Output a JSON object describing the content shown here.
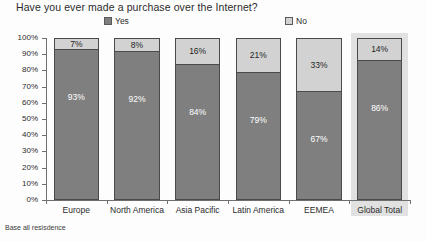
{
  "chart_data": {
    "type": "bar",
    "subtype": "stacked-100-percent",
    "title": "Have you ever made a purchase over the Internet?",
    "xlabel": "",
    "ylabel": "",
    "ylim": [
      0,
      100
    ],
    "ytick_labels": [
      "100%",
      "90%",
      "80%",
      "70%",
      "60%",
      "50%",
      "40%",
      "30%",
      "20%",
      "10%",
      "0%"
    ],
    "ytick_values": [
      100,
      90,
      80,
      70,
      60,
      50,
      40,
      30,
      20,
      10,
      0
    ],
    "grid": false,
    "legend_position": "top-center",
    "categories": [
      "Europe",
      "North America",
      "Asia Pacific",
      "Latin America",
      "EEMEA",
      "Global Total"
    ],
    "series": [
      {
        "name": "Yes",
        "color": "#7f7f7f",
        "values": [
          93,
          92,
          84,
          79,
          67,
          86
        ],
        "labels": [
          "93%",
          "92%",
          "84%",
          "79%",
          "67%",
          "86%"
        ]
      },
      {
        "name": "No",
        "color": "#d2d2d2",
        "values": [
          7,
          8,
          16,
          21,
          33,
          14
        ],
        "labels": [
          "7%",
          "8%",
          "16%",
          "21%",
          "33%",
          "14%"
        ]
      }
    ],
    "highlighted_category": "Global Total",
    "annotations": [
      "Base all resisdence"
    ]
  },
  "legend": {
    "yes_label": "Yes",
    "no_label": "No"
  },
  "footnote": "Base all resisdence"
}
